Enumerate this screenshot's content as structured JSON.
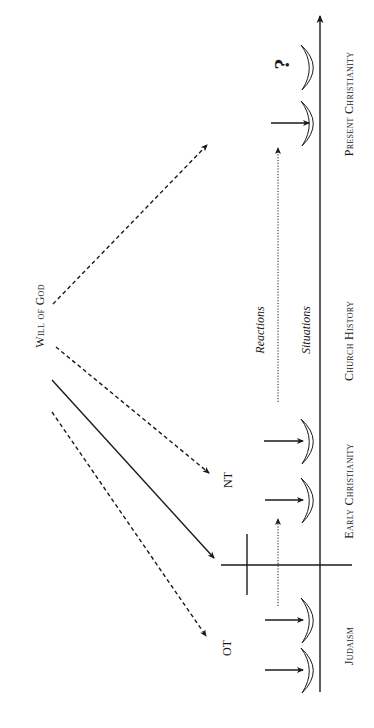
{
  "diagram": {
    "title": "Will of God",
    "source_label": "Will of God",
    "scripture_labels": {
      "ot": "OT",
      "nt": "NT"
    },
    "timeline": {
      "periods": [
        {
          "id": "judaism",
          "label": "Judaism"
        },
        {
          "id": "early-christianity",
          "label": "Early Christianity"
        },
        {
          "id": "church-history",
          "label": "Church History"
        },
        {
          "id": "present-christianity",
          "label": "Present Christianity"
        }
      ]
    },
    "flow_labels": {
      "reactions": "Reactions",
      "situations": "Situations"
    },
    "unknown_marker": "?",
    "colors": {
      "ink": "#1a1a1a",
      "background": "#ffffff"
    }
  }
}
